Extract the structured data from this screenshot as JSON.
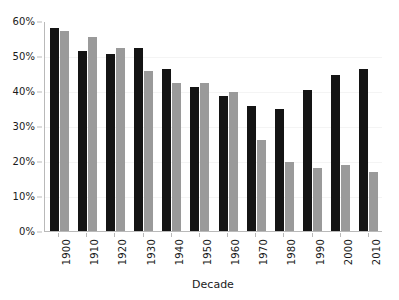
{
  "chart_data": {
    "type": "bar",
    "title": "",
    "subtitle": "",
    "xlabel": "Decade",
    "ylabel": "",
    "categories": [
      "1900",
      "1910",
      "1920",
      "1930",
      "1940",
      "1950",
      "1960",
      "1970",
      "1980",
      "1990",
      "2000",
      "2010"
    ],
    "series": [
      {
        "name": "series-1",
        "color": "#141414",
        "values": [
          58.0,
          51.3,
          50.6,
          52.2,
          46.2,
          41.1,
          38.6,
          35.6,
          34.9,
          40.3,
          44.5,
          46.3
        ]
      },
      {
        "name": "series-2",
        "color": "#9a9a9a",
        "values": [
          57.1,
          55.4,
          52.4,
          45.8,
          42.3,
          42.3,
          39.6,
          26.1,
          19.7,
          18.0,
          18.9,
          17.0
        ]
      }
    ],
    "ylim": [
      0,
      60
    ],
    "ytick_values": [
      0,
      10,
      20,
      30,
      40,
      50,
      60
    ],
    "ytick_labels": [
      "0%",
      "10%",
      "20%",
      "30%",
      "40%",
      "50%",
      "60%"
    ],
    "grid": true,
    "grid_axis": "y",
    "legend": false,
    "legend_position": "none",
    "annotations": []
  },
  "axes": {
    "x_title": "Decade"
  },
  "colors": {
    "background": "#ffffff",
    "axis_line": "#b9b9b9",
    "gridline": "#f4f4f4",
    "text": "#1a1a1a",
    "bar_black": "#141414",
    "bar_gray": "#9a9a9a"
  }
}
